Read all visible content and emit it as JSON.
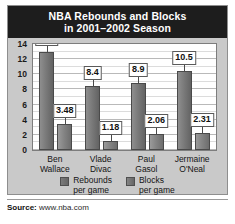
{
  "title": {
    "line1": "NBA Rebounds and Blocks",
    "line2": "in 2001–2002 Season"
  },
  "source": {
    "label": "Source:",
    "value": "www.nba.com"
  },
  "legend": [
    {
      "name": "rebounds",
      "line1": "Rebounds",
      "line2": "per game",
      "color": "#7a7a7a"
    },
    {
      "name": "blocks",
      "line1": "Blocks",
      "line2": "per game",
      "color": "#848484"
    }
  ],
  "colors": {
    "title_band": "#1d1d1d",
    "panel_background": "#c9c9c9",
    "plot_background": "#ffffff",
    "bar_rebounds": "#7a7a7a",
    "bar_blocks": "#848484",
    "gridline": "#b9b9b9"
  },
  "chart_data": {
    "type": "bar",
    "title": "NBA Rebounds and Blocks in 2001–2002 Season",
    "xlabel": "",
    "ylabel": "",
    "ylim": [
      0,
      14
    ],
    "yticks": [
      0,
      2,
      4,
      6,
      8,
      10,
      12,
      14
    ],
    "ytick_labels": [
      "0",
      "2",
      "4",
      "6",
      "8",
      "10",
      "12",
      "14"
    ],
    "grid": true,
    "legend_position": "bottom",
    "categories": [
      "Ben Wallace",
      "Vlade Divac",
      "Paul Gasol",
      "Jermaine O'Neal"
    ],
    "category_lines": [
      [
        "Ben",
        "Wallace"
      ],
      [
        "Vlade",
        "Divac"
      ],
      [
        "Paul",
        "Gasol"
      ],
      [
        "Jermaine",
        "O'Neal"
      ]
    ],
    "series": [
      {
        "name": "Rebounds per game",
        "values": [
          13.0,
          8.4,
          8.9,
          10.5
        ],
        "labels": [
          "13.0",
          "8.4",
          "8.9",
          "10.5"
        ]
      },
      {
        "name": "Blocks per game",
        "values": [
          3.48,
          1.18,
          2.06,
          2.31
        ],
        "labels": [
          "3.48",
          "1.18",
          "2.06",
          "2.31"
        ]
      }
    ]
  }
}
